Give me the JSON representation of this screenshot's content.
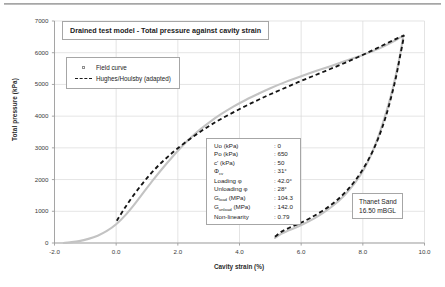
{
  "chart_data": {
    "type": "line",
    "title": "Drained test model - Total pressure against cavity strain",
    "xlabel": "Cavity strain (%)",
    "ylabel": "Total pressure (kPa)",
    "xlim": [
      -2.0,
      10.0
    ],
    "ylim": [
      0,
      7000
    ],
    "xticks": [
      "-2.0",
      "0.0",
      "2.0",
      "4.0",
      "6.0",
      "8.0",
      "10.0"
    ],
    "yticks": [
      "0",
      "1000",
      "2000",
      "3000",
      "4000",
      "5000",
      "6000",
      "7000"
    ],
    "grid": true,
    "legend_position": "upper-left-inside",
    "series": [
      {
        "name": "Field curve",
        "style": "solid-grey",
        "color": "#c3c3c3",
        "points": [
          [
            -1.7,
            0
          ],
          [
            -1.5,
            20
          ],
          [
            -1.2,
            60
          ],
          [
            -0.9,
            130
          ],
          [
            -0.6,
            230
          ],
          [
            -0.3,
            380
          ],
          [
            0.0,
            590
          ],
          [
            0.3,
            880
          ],
          [
            0.6,
            1230
          ],
          [
            0.9,
            1610
          ],
          [
            1.2,
            1990
          ],
          [
            1.5,
            2350
          ],
          [
            1.8,
            2690
          ],
          [
            2.1,
            3010
          ],
          [
            2.4,
            3300
          ],
          [
            2.7,
            3560
          ],
          [
            3.0,
            3790
          ],
          [
            3.4,
            4060
          ],
          [
            3.8,
            4300
          ],
          [
            4.2,
            4510
          ],
          [
            4.6,
            4700
          ],
          [
            5.0,
            4880
          ],
          [
            5.5,
            5080
          ],
          [
            6.0,
            5260
          ],
          [
            6.5,
            5430
          ],
          [
            7.0,
            5590
          ],
          [
            7.5,
            5760
          ],
          [
            8.0,
            5930
          ],
          [
            8.5,
            6120
          ],
          [
            9.0,
            6360
          ],
          [
            9.25,
            6500
          ],
          [
            9.3,
            6490
          ],
          [
            9.2,
            5900
          ],
          [
            9.05,
            5200
          ],
          [
            8.9,
            4600
          ],
          [
            8.72,
            4000
          ],
          [
            8.52,
            3400
          ],
          [
            8.3,
            2850
          ],
          [
            8.05,
            2350
          ],
          [
            7.75,
            1900
          ],
          [
            7.4,
            1500
          ],
          [
            7.0,
            1150
          ],
          [
            6.6,
            880
          ],
          [
            6.2,
            660
          ],
          [
            5.9,
            520
          ],
          [
            5.6,
            400
          ],
          [
            5.35,
            290
          ],
          [
            5.2,
            190
          ],
          [
            5.15,
            160
          ]
        ]
      },
      {
        "name": "Hughes/Houlsby (adapted)",
        "style": "dashed-black",
        "color": "#141414",
        "points": [
          [
            0.02,
            700
          ],
          [
            0.25,
            1060
          ],
          [
            0.5,
            1420
          ],
          [
            0.8,
            1810
          ],
          [
            1.1,
            2160
          ],
          [
            1.4,
            2470
          ],
          [
            1.7,
            2740
          ],
          [
            2.0,
            2990
          ],
          [
            2.35,
            3250
          ],
          [
            2.7,
            3490
          ],
          [
            3.05,
            3710
          ],
          [
            3.4,
            3910
          ],
          [
            3.8,
            4120
          ],
          [
            4.2,
            4320
          ],
          [
            4.6,
            4510
          ],
          [
            5.0,
            4690
          ],
          [
            5.45,
            4880
          ],
          [
            5.9,
            5070
          ],
          [
            6.35,
            5250
          ],
          [
            6.8,
            5430
          ],
          [
            7.25,
            5610
          ],
          [
            7.7,
            5800
          ],
          [
            8.15,
            6000
          ],
          [
            8.6,
            6210
          ],
          [
            9.0,
            6400
          ],
          [
            9.28,
            6520
          ],
          [
            9.32,
            6470
          ],
          [
            9.2,
            5850
          ],
          [
            9.08,
            5250
          ],
          [
            8.94,
            4680
          ],
          [
            8.78,
            4100
          ],
          [
            8.6,
            3560
          ],
          [
            8.38,
            3020
          ],
          [
            8.12,
            2520
          ],
          [
            7.82,
            2060
          ],
          [
            7.48,
            1650
          ],
          [
            7.1,
            1300
          ],
          [
            6.7,
            1020
          ],
          [
            6.3,
            790
          ],
          [
            5.95,
            620
          ],
          [
            5.62,
            480
          ],
          [
            5.35,
            350
          ],
          [
            5.18,
            220
          ],
          [
            5.12,
            175
          ]
        ]
      }
    ],
    "annotations": {
      "parameters_box": [
        {
          "key": "Uo (kPa)",
          "sep": ": 0"
        },
        {
          "key": "Po (kPa)",
          "sep": ": 650"
        },
        {
          "key": "c' (kPa)",
          "sep": ": 50"
        },
        {
          "key": "Φcv",
          "sep": ": 31°"
        },
        {
          "key": "Loading φ",
          "sep": ": 42.0°"
        },
        {
          "key": "Unloading φ",
          "sep": ": 28°"
        },
        {
          "key": "Gload (MPa)",
          "sep": ": 104.3"
        },
        {
          "key": "Gunload (MPa)",
          "sep": ": 142.0"
        },
        {
          "key": "Non-linearity",
          "sep": ": 0.79"
        }
      ],
      "site_box": [
        "Thanet Sand",
        "16.50 mBGL"
      ]
    }
  },
  "title_box": {
    "text": "Drained test model - Total pressure against cavity strain"
  },
  "legend": {
    "items": [
      {
        "label": "Field curve",
        "key": "square-marker"
      },
      {
        "label": "Hughes/Houlsby (adapted)",
        "key": "dashed-line"
      }
    ]
  },
  "params": {
    "rows": [
      {
        "key": "Uo (kPa)",
        "value": ": 0"
      },
      {
        "key": "Po (kPa)",
        "value": ": 650"
      },
      {
        "key": "c' (kPa)",
        "value": ": 50"
      },
      {
        "key_main": "Φ",
        "key_sub": "cv",
        "value": ": 31°"
      },
      {
        "key": "Loading φ",
        "value": ": 42.0°"
      },
      {
        "key": "Unloading φ",
        "value": ": 28°"
      },
      {
        "key_main": "G",
        "key_sub": "load",
        "key_tail": " (MPa)",
        "value": ": 104.3"
      },
      {
        "key_main": "G",
        "key_sub": "unload",
        "key_tail": " (MPa)",
        "value": ": 142.0"
      },
      {
        "key": "Non-linearity",
        "value": ": 0.79"
      }
    ]
  },
  "site": {
    "line1": "Thanet Sand",
    "line2": "16.50 mBGL"
  },
  "axes": {
    "y_label": "Total pressure (kPa)",
    "x_label": "Cavity strain (%)",
    "y_ticks": [
      "7000",
      "6000",
      "5000",
      "4000",
      "3000",
      "2000",
      "1000",
      "0"
    ],
    "x_ticks": [
      "-2.0",
      "0.0",
      "2.0",
      "4.0",
      "6.0",
      "8.0",
      "10.0"
    ]
  },
  "colors": {
    "field_curve": "#c3c3c3",
    "model_curve": "#141414",
    "grid": "#d9d9d9",
    "axis": "#9d9d9d",
    "box_border": "#a6a6a6"
  }
}
